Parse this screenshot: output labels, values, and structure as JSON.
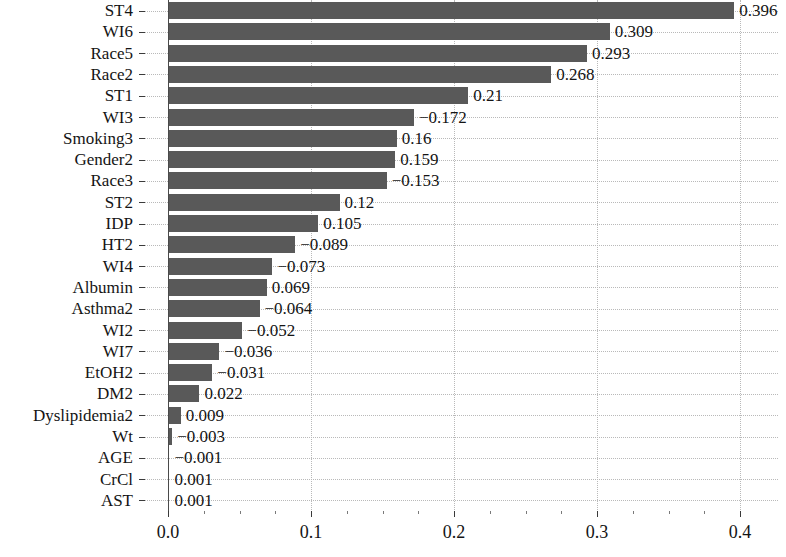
{
  "chart_data": {
    "type": "bar",
    "orientation": "horizontal",
    "title": "",
    "xlabel": "",
    "ylabel": "",
    "xlim": [
      0.0,
      0.42
    ],
    "xticks": [
      "0.0",
      "0.1",
      "0.2",
      "0.3",
      "0.4"
    ],
    "xtick_values": [
      0.0,
      0.1,
      0.2,
      0.3,
      0.4
    ],
    "grid": true,
    "grid_style": "dotted",
    "legend": "none",
    "bar_color": "#595959",
    "grid_color": "#b9b9b9",
    "axis_color": "#4a4a4a",
    "note": "Bar length encodes absolute value; printed label shows signed value.",
    "categories": [
      "ST4",
      "WI6",
      "Race5",
      "Race2",
      "ST1",
      "WI3",
      "Smoking3",
      "Gender2",
      "Race3",
      "ST2",
      "IDP",
      "HT2",
      "WI4",
      "Albumin",
      "Asthma2",
      "WI2",
      "WI7",
      "EtOH2",
      "DM2",
      "Dyslipidemia2",
      "Wt",
      "AGE",
      "CrCl",
      "AST"
    ],
    "values": [
      0.396,
      0.309,
      0.293,
      0.268,
      0.21,
      -0.172,
      0.16,
      0.159,
      -0.153,
      0.12,
      0.105,
      -0.089,
      -0.073,
      0.069,
      -0.064,
      -0.052,
      -0.036,
      -0.031,
      0.022,
      0.009,
      -0.003,
      -0.001,
      0.001,
      0.001
    ],
    "value_labels": [
      "0.396",
      "0.309",
      "0.293",
      "0.268",
      "0.21",
      "−0.172",
      "0.16",
      "0.159",
      "−0.153",
      "0.12",
      "0.105",
      "−0.089",
      "−0.073",
      "0.069",
      "−0.064",
      "−0.052",
      "−0.036",
      "−0.031",
      "0.022",
      "0.009",
      "−0.003",
      "−0.001",
      "0.001",
      "0.001"
    ],
    "magnitudes": [
      0.396,
      0.309,
      0.293,
      0.268,
      0.21,
      0.172,
      0.16,
      0.159,
      0.153,
      0.12,
      0.105,
      0.089,
      0.073,
      0.069,
      0.064,
      0.052,
      0.036,
      0.031,
      0.022,
      0.009,
      0.003,
      0.001,
      0.001,
      0.001
    ]
  }
}
